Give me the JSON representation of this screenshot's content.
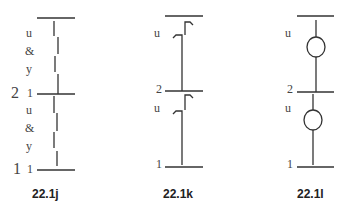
{
  "figures": [
    {
      "id": "22.1j",
      "caption": "22.1j",
      "level_labels": [
        "2",
        "1"
      ],
      "upper_segment_labels": [
        "u",
        "&",
        "y",
        "1"
      ],
      "lower_segment_labels": [
        "u",
        "&",
        "y",
        "1"
      ]
    },
    {
      "id": "22.1k",
      "caption": "22.1k",
      "level_labels": [
        "2",
        "1"
      ],
      "upper_segment_labels": [
        "u"
      ],
      "lower_segment_labels": [
        "u"
      ]
    },
    {
      "id": "22.1l",
      "caption": "22.1l",
      "level_labels": [
        "2",
        "1"
      ],
      "upper_segment_labels": [
        "u"
      ],
      "lower_segment_labels": [
        "u"
      ]
    }
  ]
}
